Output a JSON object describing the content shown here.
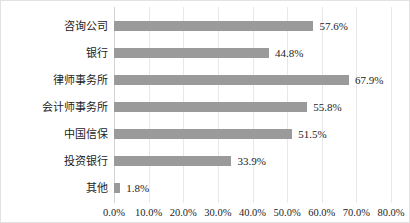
{
  "chart_data": {
    "type": "bar",
    "orientation": "horizontal",
    "title": "",
    "subtitle": "",
    "xlabel": "",
    "ylabel": "",
    "grid": true,
    "legend": "none",
    "xlim": [
      0,
      80
    ],
    "xtick_labels": [
      "0.0%",
      "10.0%",
      "20.0%",
      "30.0%",
      "40.0%",
      "50.0%",
      "60.0%",
      "70.0%",
      "80.0%"
    ],
    "xtick_values": [
      0,
      10,
      20,
      30,
      40,
      50,
      60,
      70,
      80
    ],
    "bar_color": "#9a9a9a",
    "categories": [
      "咨询公司",
      "银行",
      "律师事务所",
      "会计师事务所",
      "中国信保",
      "投资银行",
      "其他"
    ],
    "values": [
      57.6,
      44.8,
      67.9,
      55.8,
      51.5,
      33.9,
      1.8
    ],
    "value_labels": [
      "57.6%",
      "44.8%",
      "67.9%",
      "55.8%",
      "51.5%",
      "33.9%",
      "1.8%"
    ],
    "bars": [
      {
        "category": "咨询公司",
        "value": 57.6,
        "label": "57.6%"
      },
      {
        "category": "银行",
        "value": 44.8,
        "label": "44.8%"
      },
      {
        "category": "律师事务所",
        "value": 67.9,
        "label": "67.9%"
      },
      {
        "category": "会计师事务所",
        "value": 55.8,
        "label": "55.8%"
      },
      {
        "category": "中国信保",
        "value": 51.5,
        "label": "51.5%"
      },
      {
        "category": "投资银行",
        "value": 33.9,
        "label": "33.9%"
      },
      {
        "category": "其他",
        "value": 1.8,
        "label": "1.8%"
      }
    ]
  }
}
